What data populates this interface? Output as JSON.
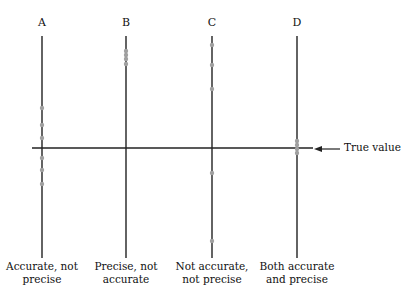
{
  "diagram": {
    "true_value_label": "True value",
    "columns": [
      {
        "letter": "A",
        "caption_line1": "Accurate, not",
        "caption_line2": "precise",
        "x": 42,
        "dots_y": [
          108,
          125,
          138,
          158,
          170,
          184
        ]
      },
      {
        "letter": "B",
        "caption_line1": "Precise, not",
        "caption_line2": "accurate",
        "x": 126,
        "dots_y": [
          51,
          55,
          59,
          64
        ]
      },
      {
        "letter": "C",
        "caption_line1": "Not accurate,",
        "caption_line2": "not precise",
        "x": 212,
        "dots_y": [
          45,
          65,
          89,
          173,
          241
        ]
      },
      {
        "letter": "D",
        "caption_line1": "Both accurate",
        "caption_line2": "and precise",
        "x": 297,
        "dots_y": [
          141,
          145,
          149,
          153
        ]
      }
    ],
    "colors": {
      "line": "#222222",
      "dot": "#a0a0a0"
    }
  }
}
